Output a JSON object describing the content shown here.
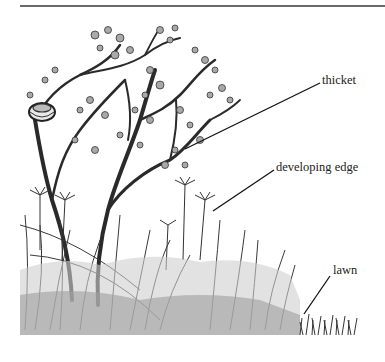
{
  "figure": {
    "labels": [
      {
        "id": "thicket",
        "text": "thicket"
      },
      {
        "id": "developing-edge",
        "text": "developing edge"
      },
      {
        "id": "lawn",
        "text": "lawn"
      }
    ],
    "elements": [
      "tree-with-nest",
      "umbellifer-flowers",
      "tall-grasses",
      "dense-groundcover",
      "short-lawn-grass"
    ]
  }
}
